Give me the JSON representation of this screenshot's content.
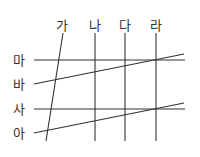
{
  "diagram": {
    "columns": [
      {
        "label": "가",
        "label_x": 62,
        "label_y": 25,
        "line": [
          63,
          33,
          46,
          141
        ]
      },
      {
        "label": "나",
        "label_x": 95,
        "label_y": 25,
        "line": [
          95,
          33,
          95,
          141
        ]
      },
      {
        "label": "다",
        "label_x": 125,
        "label_y": 25,
        "line": [
          125,
          33,
          125,
          141
        ]
      },
      {
        "label": "라",
        "label_x": 156,
        "label_y": 25,
        "line": [
          156,
          33,
          156,
          141
        ]
      }
    ],
    "rows": [
      {
        "label": "마",
        "label_x": 19,
        "label_y": 60,
        "line": [
          34,
          60,
          185,
          60
        ]
      },
      {
        "label": "바",
        "label_x": 19,
        "label_y": 84,
        "line": [
          34,
          84,
          184,
          54
        ]
      },
      {
        "label": "사",
        "label_x": 19,
        "label_y": 109,
        "line": [
          34,
          109,
          185,
          109
        ]
      },
      {
        "label": "아",
        "label_x": 19,
        "label_y": 133,
        "line": [
          34,
          133,
          184,
          103
        ]
      }
    ],
    "line_color": "#333333",
    "text_color": "#333333"
  }
}
